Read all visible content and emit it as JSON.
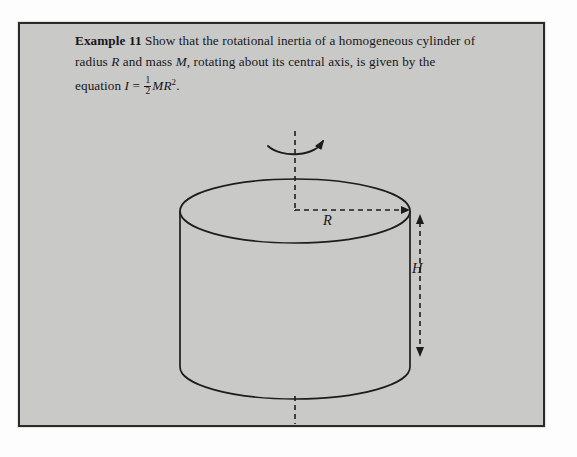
{
  "document": {
    "type": "textbook-figure",
    "background_color": "#fdfdfd",
    "panel_color": "#c9c9c7",
    "border_color": "#2a2a2a",
    "ink_color": "#17171a"
  },
  "example": {
    "lead_label": "Example 11",
    "line1_text": " Show that the rotational inertia of a homogeneous",
    "line2_pre": "cylinder of radius ",
    "line2_var_R": "R",
    "line2_mid": " and mass ",
    "line2_var_M": "M",
    "line2_post": ", rotating about its central axis,",
    "line3_pre": "is given by the equation ",
    "line3_var_I": "I",
    "line3_equals": " = ",
    "fraction_numerator": "1",
    "fraction_denominator": "2",
    "line3_expr": "MR",
    "line3_exponent": "2",
    "line3_period": "."
  },
  "figure": {
    "shape_name": "homogeneous cylinder",
    "radius_label": "R",
    "height_label": "H",
    "axis_style": "dashed",
    "rotation_arrow": "curved-arrow-clockwise",
    "radius_arrow": "dashed-arrow-right",
    "height_arrow": "dashed-double-arrow-vertical",
    "geometry": {
      "center_x": 275,
      "top_ellipse_cy": 187,
      "ellipse_rx": 115,
      "ellipse_ry": 32,
      "body_bottom_y": 343,
      "axis_top_y": 107,
      "axis_bottom_y": 400
    }
  }
}
